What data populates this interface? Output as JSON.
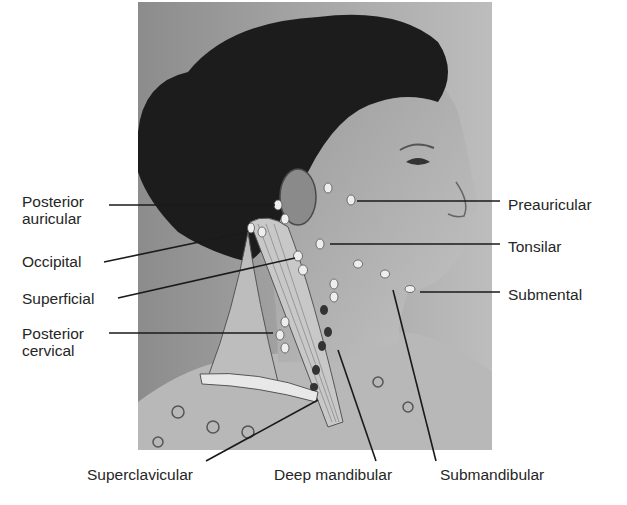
{
  "figure": {
    "labels_left": [
      {
        "id": "posterior-auricular",
        "line1": "Posterior",
        "line2": "auricular"
      },
      {
        "id": "occipital",
        "line1": "Occipital"
      },
      {
        "id": "superficial",
        "line1": "Superficial"
      },
      {
        "id": "posterior-cervical",
        "line1": "Posterior",
        "line2": "cervical"
      }
    ],
    "labels_right": [
      {
        "id": "preauricular",
        "line1": "Preauricular"
      },
      {
        "id": "tonsilar",
        "line1": "Tonsilar"
      },
      {
        "id": "submental",
        "line1": "Submental"
      }
    ],
    "labels_bottom": [
      {
        "id": "superclavicular",
        "line1": "Superclavicular"
      },
      {
        "id": "deep-mandibular",
        "line1": "Deep mandibular"
      },
      {
        "id": "submandibular",
        "line1": "Submandibular"
      }
    ]
  }
}
